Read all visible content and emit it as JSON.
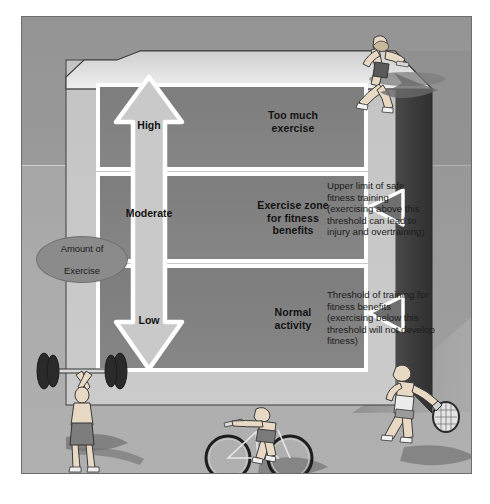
{
  "diagram": {
    "axis_bubble": {
      "line1": "Amount of",
      "line2": "Exercise"
    },
    "arrow": {
      "name": "double-headed-vertical-arrow",
      "levels": [
        {
          "key": "high",
          "label": "High"
        },
        {
          "key": "moderate",
          "label": "Moderate"
        },
        {
          "key": "low",
          "label": "Low"
        }
      ]
    },
    "zones": [
      {
        "key": "too-much",
        "line1": "Too much",
        "line2": "exercise",
        "line3": ""
      },
      {
        "key": "benefit",
        "line1": "Exercise zone",
        "line2": "for fitness",
        "line3": "benefits"
      },
      {
        "key": "normal",
        "line1": "Normal",
        "line2": "activity",
        "line3": ""
      }
    ],
    "notes": [
      {
        "key": "upper-limit",
        "text": "Upper limit of safe fitness training (exercising above this threshold can lead to injury and overtraining)"
      },
      {
        "key": "lower-threshold",
        "text": "Threshold of training for fitness benefits (exercising below this threshold will not develop fitness)"
      }
    ],
    "figures": [
      {
        "key": "runner",
        "name": "running-figure-icon"
      },
      {
        "key": "weightlifter",
        "name": "weightlifter-figure-icon"
      },
      {
        "key": "cyclist",
        "name": "cyclist-figure-icon"
      },
      {
        "key": "tennis",
        "name": "tennis-player-figure-icon"
      }
    ],
    "colors": {
      "panel_background": "#a5a5a5",
      "back_wall": "#979797",
      "block_front": "#c9c9c9",
      "block_top": "#d9d9d9",
      "block_side": "#3f3f3f",
      "zone_fill": "#808080",
      "arrow_fill": "#c9c9c9",
      "arrow_outline": "#ffffff",
      "pointer_fill": "#6f6f6f",
      "bubble_fill": "#8b8b8b",
      "text": "#121212"
    }
  }
}
